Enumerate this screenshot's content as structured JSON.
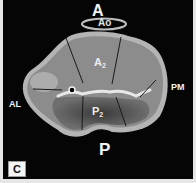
{
  "figure": {
    "panel_label": "C",
    "labels": {
      "anterior": "A",
      "aorta": "Ao",
      "region_a": "A",
      "region_a_sub": "2",
      "region_p": "P",
      "region_p_sub": "2",
      "posterior": "P",
      "anterolateral": "AL",
      "posteromedial": "PM"
    },
    "colors": {
      "background": "#050505",
      "border": "#e6e6e6",
      "tissue": "#8a8a8a",
      "rim": "#b8b8b8",
      "label": "#f2f2f2"
    }
  }
}
